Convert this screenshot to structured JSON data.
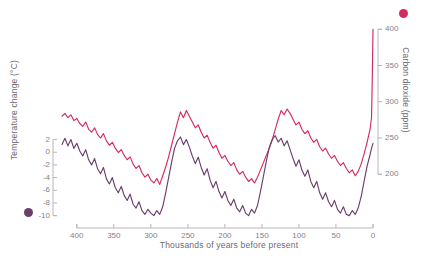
{
  "chart_data": {
    "type": "line",
    "title": "",
    "xlabel": "Thousands of years before present",
    "xticks": [
      400,
      350,
      300,
      250,
      200,
      150,
      100,
      50,
      0
    ],
    "xlim": [
      420,
      0
    ],
    "grid": false,
    "legend_position": "axis-titles",
    "series": [
      {
        "name": "Carbon dioxide (ppm)",
        "axis": "right",
        "color": "#d42a5e",
        "ylabel": "Carbon dioxide (ppm)",
        "yticks": [
          200,
          250,
          300,
          350,
          400
        ],
        "ylim": [
          170,
          410
        ],
        "x": [
          420,
          416,
          412,
          408,
          404,
          400,
          396,
          392,
          388,
          384,
          380,
          376,
          372,
          368,
          364,
          360,
          356,
          352,
          348,
          344,
          340,
          336,
          332,
          328,
          324,
          320,
          316,
          312,
          308,
          304,
          300,
          296,
          292,
          288,
          284,
          280,
          276,
          272,
          268,
          264,
          260,
          256,
          252,
          248,
          244,
          240,
          236,
          232,
          228,
          224,
          220,
          216,
          212,
          208,
          204,
          200,
          196,
          192,
          188,
          184,
          180,
          176,
          172,
          168,
          164,
          160,
          156,
          152,
          148,
          144,
          140,
          136,
          132,
          128,
          124,
          120,
          116,
          112,
          108,
          104,
          100,
          96,
          92,
          88,
          84,
          80,
          76,
          72,
          68,
          64,
          60,
          56,
          52,
          48,
          44,
          40,
          36,
          32,
          28,
          24,
          20,
          16,
          12,
          8,
          4,
          2,
          1,
          0
        ],
        "values": [
          280,
          284,
          278,
          282,
          274,
          277,
          270,
          266,
          272,
          262,
          258,
          264,
          255,
          250,
          256,
          246,
          240,
          244,
          236,
          230,
          234,
          226,
          220,
          224,
          214,
          208,
          212,
          202,
          196,
          200,
          192,
          188,
          194,
          186,
          198,
          210,
          224,
          240,
          256,
          272,
          286,
          278,
          288,
          280,
          272,
          264,
          268,
          258,
          250,
          254,
          244,
          236,
          240,
          230,
          222,
          226,
          218,
          212,
          216,
          206,
          200,
          204,
          196,
          190,
          194,
          188,
          196,
          206,
          216,
          226,
          236,
          248,
          262,
          276,
          288,
          282,
          290,
          284,
          276,
          268,
          272,
          262,
          256,
          260,
          250,
          244,
          248,
          238,
          232,
          236,
          228,
          222,
          226,
          218,
          212,
          216,
          208,
          202,
          206,
          198,
          204,
          214,
          228,
          244,
          262,
          278,
          330,
          400
        ]
      },
      {
        "name": "Temperature change (°C)",
        "axis": "left",
        "color": "#6b3f6b",
        "ylabel": "Temperature change (°C)",
        "yticks": [
          2,
          0,
          -2,
          -4,
          -6,
          -8,
          -10
        ],
        "ylim": [
          -11,
          3.5
        ],
        "x": [
          420,
          416,
          412,
          408,
          404,
          400,
          396,
          392,
          388,
          384,
          380,
          376,
          372,
          368,
          364,
          360,
          356,
          352,
          348,
          344,
          340,
          336,
          332,
          328,
          324,
          320,
          316,
          312,
          308,
          304,
          300,
          296,
          292,
          288,
          284,
          280,
          276,
          272,
          268,
          264,
          260,
          256,
          252,
          248,
          244,
          240,
          236,
          232,
          228,
          224,
          220,
          216,
          212,
          208,
          204,
          200,
          196,
          192,
          188,
          184,
          180,
          176,
          172,
          168,
          164,
          160,
          156,
          152,
          148,
          144,
          140,
          136,
          132,
          128,
          124,
          120,
          116,
          112,
          108,
          104,
          100,
          96,
          92,
          88,
          84,
          80,
          76,
          72,
          68,
          64,
          60,
          56,
          52,
          48,
          44,
          40,
          36,
          32,
          28,
          24,
          20,
          16,
          12,
          8,
          4,
          2,
          1,
          0
        ],
        "values": [
          1.2,
          2.2,
          1.0,
          2.0,
          0.6,
          1.4,
          0.2,
          -0.6,
          0.4,
          -1.2,
          -2.0,
          -1.0,
          -2.6,
          -3.4,
          -2.4,
          -4.2,
          -5.0,
          -4.0,
          -5.6,
          -6.4,
          -5.4,
          -6.8,
          -7.6,
          -6.6,
          -8.2,
          -8.8,
          -7.8,
          -9.2,
          -9.8,
          -9.0,
          -9.6,
          -10.0,
          -9.2,
          -9.8,
          -8.6,
          -6.4,
          -4.0,
          -1.6,
          0.6,
          1.8,
          2.4,
          1.2,
          2.0,
          0.8,
          -0.6,
          -1.8,
          -0.8,
          -2.4,
          -3.6,
          -2.6,
          -4.4,
          -5.6,
          -4.6,
          -6.2,
          -7.2,
          -6.2,
          -7.6,
          -8.4,
          -7.4,
          -8.8,
          -9.4,
          -8.4,
          -9.6,
          -10.0,
          -9.0,
          -9.6,
          -8.4,
          -6.2,
          -3.8,
          -1.4,
          0.8,
          2.0,
          2.6,
          1.6,
          2.2,
          1.0,
          1.8,
          0.4,
          -1.0,
          -2.2,
          -1.2,
          -2.8,
          -3.8,
          -2.8,
          -4.6,
          -5.6,
          -4.6,
          -6.4,
          -7.4,
          -6.4,
          -7.8,
          -8.6,
          -7.6,
          -9.0,
          -9.6,
          -8.6,
          -9.8,
          -10.0,
          -9.2,
          -9.8,
          -8.8,
          -7.0,
          -4.6,
          -2.2,
          -0.4,
          0.6,
          1.0,
          1.4
        ]
      }
    ]
  },
  "axes": {
    "left_title": "Temperature change (°C)",
    "right_title": "Carbon dioxide (ppm)",
    "x_title": "Thousands of years before present",
    "left_ticks": [
      "2",
      "0",
      "-2",
      "-4",
      "-6",
      "-8",
      "-10"
    ],
    "right_ticks": [
      "400",
      "350",
      "300",
      "250",
      "200"
    ],
    "x_ticks": [
      "400",
      "350",
      "300",
      "250",
      "200",
      "150",
      "100",
      "50",
      "0"
    ]
  },
  "colors": {
    "co2": "#d42a5e",
    "temperature": "#6b3f6b",
    "axis": "#b9b5bd",
    "text": "#85818a",
    "title_text": "#6e6a72"
  },
  "legend": {
    "co2_marker": "co2-dot",
    "temperature_marker": "temperature-dot"
  }
}
